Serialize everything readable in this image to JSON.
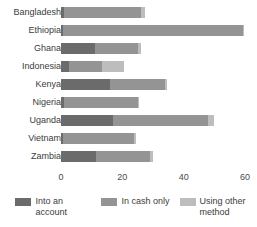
{
  "chart_data": {
    "type": "bar",
    "orientation": "horizontal",
    "stacked": true,
    "title": "",
    "subtitle": "",
    "xlabel": "",
    "ylabel": "",
    "xlim": [
      0,
      60
    ],
    "grid": false,
    "legend_position": "bottom",
    "categories": [
      "Bangladesh",
      "Ethiopia",
      "Ghana",
      "Indonesia",
      "Kenya",
      "Nigeria",
      "Uganda",
      "Vietnam",
      "Zambia"
    ],
    "xticks": [
      0,
      20,
      40,
      60
    ],
    "xtick_labels": [
      "0",
      "20",
      "40",
      "60"
    ],
    "series": [
      {
        "name": "Into an account",
        "color": "#6b6b6b",
        "values": [
          1.0,
          0.8,
          11.0,
          2.5,
          16.0,
          1.0,
          17.0,
          0.8,
          11.5
        ]
      },
      {
        "name": "In cash only",
        "color": "#949494",
        "values": [
          25.0,
          58.5,
          14.0,
          11.0,
          18.0,
          24.0,
          31.0,
          23.0,
          17.5
        ]
      },
      {
        "name": "Using other method",
        "color": "#bdbdbd",
        "values": [
          1.5,
          0.5,
          1.0,
          7.0,
          0.5,
          0.5,
          2.0,
          0.5,
          1.0
        ]
      }
    ],
    "totals": [
      27.5,
      59.8,
      26.0,
      20.5,
      34.5,
      25.5,
      50.0,
      24.3,
      30.0
    ]
  },
  "legend": {
    "items": [
      {
        "label": "Into an account",
        "color": "#6b6b6b"
      },
      {
        "label": "In cash only",
        "color": "#949494"
      },
      {
        "label": "Using other method",
        "color": "#bdbdbd"
      }
    ]
  }
}
